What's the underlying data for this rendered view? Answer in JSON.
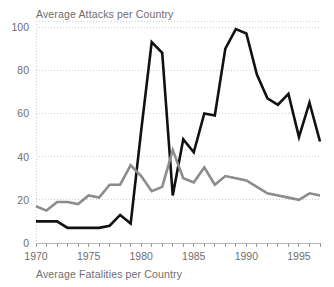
{
  "chart_data": {
    "type": "line",
    "title": "",
    "top_label": "Average Attacks per Country",
    "bottom_label": "Average Fatalities per Country",
    "xlabel": "",
    "ylabel": "",
    "xlim": [
      1970,
      1997
    ],
    "ylim": [
      0,
      100
    ],
    "grid": true,
    "legend_position": "none",
    "y_ticks": [
      0,
      20,
      40,
      60,
      80,
      100
    ],
    "y_tick_labels": [
      "0",
      "20",
      "40",
      "60",
      "80",
      "100"
    ],
    "x_ticks": [
      1970,
      1975,
      1980,
      1985,
      1990,
      1995
    ],
    "x_tick_labels": [
      "1970",
      "1975",
      "1980",
      "1985",
      "1990",
      "1995"
    ],
    "x_minor_tick_interval": 1,
    "x": [
      1970,
      1971,
      1972,
      1973,
      1974,
      1975,
      1976,
      1977,
      1978,
      1979,
      1980,
      1981,
      1982,
      1983,
      1984,
      1985,
      1986,
      1987,
      1988,
      1989,
      1990,
      1991,
      1992,
      1993,
      1994,
      1995,
      1996,
      1997
    ],
    "series": [
      {
        "name": "Average Attacks per Country",
        "color": "#111111",
        "stroke_width": 2.6,
        "values": [
          10,
          10,
          10,
          7,
          7,
          7,
          7,
          8,
          13,
          9,
          52,
          93,
          88,
          22,
          48,
          42,
          60,
          59,
          90,
          99,
          97,
          78,
          67,
          64,
          69,
          49,
          65,
          47
        ]
      },
      {
        "name": "Average Fatalities per Country",
        "color": "#8c8c8c",
        "stroke_width": 2.6,
        "values": [
          17,
          15,
          19,
          19,
          18,
          22,
          21,
          27,
          27,
          36,
          31,
          24,
          26,
          43,
          30,
          28,
          35,
          27,
          31,
          30,
          29,
          26,
          23,
          22,
          21,
          20,
          23,
          22
        ]
      }
    ]
  },
  "colors": {
    "attacks_line": "#111111",
    "fatalities_line": "#8c8c8c",
    "grid": "#cfcfcf",
    "text": "#6e6e6e",
    "background": "#ffffff"
  }
}
